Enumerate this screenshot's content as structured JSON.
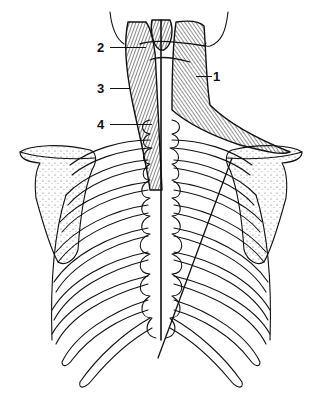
{
  "figure": {
    "line_color": "#111111",
    "background": "#ffffff"
  },
  "labels": [
    {
      "id": "1",
      "text": "1",
      "x": 213,
      "y": 70
    },
    {
      "id": "2",
      "text": "2",
      "x": 97,
      "y": 41
    },
    {
      "id": "3",
      "text": "3",
      "x": 97,
      "y": 82
    },
    {
      "id": "4",
      "text": "4",
      "x": 97,
      "y": 118
    }
  ]
}
